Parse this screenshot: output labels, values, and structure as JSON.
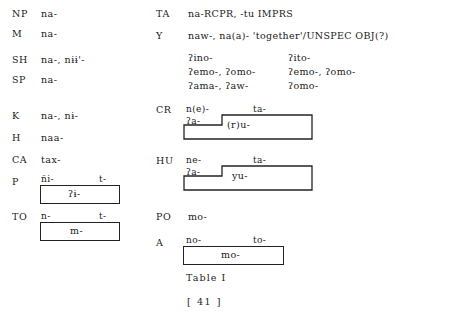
{
  "document": {
    "caption": "Table I",
    "folio": "[ 41 ]"
  },
  "left_column": {
    "rows": [
      {
        "label": "NP",
        "form": "na-"
      },
      {
        "label": "M",
        "form": "na-"
      },
      {
        "label": "SH",
        "form": "na-, nɨɨ'-"
      },
      {
        "label": "SP",
        "form": "na-"
      },
      {
        "label": "K",
        "form": "na-, nɨ-"
      },
      {
        "label": "H",
        "form": "naa-"
      },
      {
        "label": "CA",
        "form": "tax-"
      },
      {
        "label": "P",
        "form": "",
        "diagram": {
          "type": "bracket-box",
          "left_affix": "ñi-",
          "right_affix": "t-",
          "box_text": "ʔɨ-"
        }
      },
      {
        "label": "TO",
        "form": "",
        "diagram": {
          "type": "bracket-box",
          "left_affix": "n-",
          "right_affix": "t-",
          "box_text": "m-"
        }
      }
    ]
  },
  "right_column": {
    "rows": [
      {
        "label": "TA",
        "form": "na-RCPR, -tu IMPRS"
      },
      {
        "label": "Y",
        "form": "naw-, na(a)- 'together'/UNSPEC OBJ(?)",
        "sub_block": {
          "col_left": [
            "ʔino-",
            "ʔemo-, ʔomo-",
            "ʔama-, ʔaw-"
          ],
          "col_right": [
            "ʔito-",
            "ʔemo-, ʔomo-",
            "ʔomo-"
          ]
        }
      },
      {
        "label": "CR",
        "form": "",
        "diagram": {
          "type": "stepped-box",
          "upper_left_affix": "n(e)-",
          "upper_right_affix": "ta-",
          "inner_left_text": "ʔa-",
          "inner_right_text": "(r)u-"
        }
      },
      {
        "label": "HU",
        "form": "",
        "diagram": {
          "type": "stepped-box",
          "upper_left_affix": "ne-",
          "upper_right_affix": "ta-",
          "inner_left_text": "ʔa-",
          "inner_right_text": "yu-"
        }
      },
      {
        "label": "PO",
        "form": "mo-"
      },
      {
        "label": "A",
        "form": "",
        "diagram": {
          "type": "bracket-box",
          "left_affix": "no-",
          "right_affix": "to-",
          "box_text": "mo-"
        }
      }
    ]
  }
}
